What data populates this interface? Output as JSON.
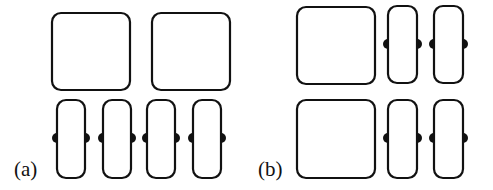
{
  "figure": {
    "panels": [
      {
        "label": "(a)",
        "label_pos": [
          14,
          159
        ],
        "squares": [
          {
            "x": 52,
            "y": 13,
            "w": 78,
            "h": 77
          },
          {
            "x": 152,
            "y": 13,
            "w": 78,
            "h": 77
          }
        ],
        "tall_rects": [
          {
            "x": 57,
            "y": 100,
            "w": 28,
            "h": 78,
            "dot_y": 138
          },
          {
            "x": 103,
            "y": 100,
            "w": 28,
            "h": 78,
            "dot_y": 138
          },
          {
            "x": 147,
            "y": 100,
            "w": 28,
            "h": 78,
            "dot_y": 138
          },
          {
            "x": 193,
            "y": 100,
            "w": 28,
            "h": 78,
            "dot_y": 138
          }
        ]
      },
      {
        "label": "(b)",
        "label_pos": [
          258,
          159
        ],
        "squares": [
          {
            "x": 297,
            "y": 7,
            "w": 78,
            "h": 77
          },
          {
            "x": 297,
            "y": 100,
            "w": 78,
            "h": 78
          }
        ],
        "tall_rects": [
          {
            "x": 388,
            "y": 6,
            "w": 29,
            "h": 77,
            "dot_y": 44
          },
          {
            "x": 434,
            "y": 6,
            "w": 29,
            "h": 77,
            "dot_y": 44
          },
          {
            "x": 388,
            "y": 100,
            "w": 29,
            "h": 78,
            "dot_y": 138
          },
          {
            "x": 434,
            "y": 100,
            "w": 29,
            "h": 78,
            "dot_y": 138
          }
        ]
      }
    ],
    "stroke_color": "#111111",
    "fill_color": "#ffffff",
    "dot_radius": 5
  }
}
